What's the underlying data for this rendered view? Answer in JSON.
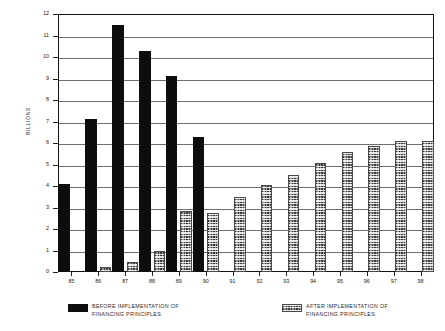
{
  "chart_data": {
    "type": "bar",
    "title": "",
    "xlabel": "",
    "ylabel": "BILLIONS",
    "ylim": [
      0,
      12
    ],
    "ytick_labels": [
      "12",
      "11",
      "10",
      "9",
      "8",
      "7",
      "6",
      "5",
      "4",
      "3",
      "2",
      "1",
      "0"
    ],
    "yticks": [
      12,
      11,
      10,
      9,
      8,
      7,
      6,
      5,
      4,
      3,
      2,
      1,
      0
    ],
    "grid": true,
    "legend_position": "below",
    "categories": [
      "85",
      "86",
      "87",
      "88",
      "89",
      "90",
      "91",
      "92",
      "93",
      "94",
      "95",
      "96",
      "97",
      "98"
    ],
    "series": [
      {
        "name": "BEFORE IMPLEMENTATION OF FINANCING PRINCIPLES",
        "color": "#0d0d0d",
        "values": [
          4.1,
          7.1,
          11.5,
          10.3,
          9.1,
          6.3,
          null,
          null,
          null,
          null,
          null,
          null,
          null,
          null
        ]
      },
      {
        "name": "AFTER IMPLEMENTATION OF FINANCING PRINCIPLES",
        "color": "#9a9a9a",
        "values": [
          null,
          0.25,
          0.45,
          1.0,
          2.85,
          2.75,
          3.5,
          4.05,
          4.5,
          5.05,
          5.6,
          5.85,
          6.1,
          6.1
        ]
      }
    ]
  },
  "axis": {
    "y_title": "BILLIONS"
  },
  "legend": {
    "entries": [
      {
        "line1": "BEFORE IMPLEMENTATION OF",
        "line2": "FINANCING PRINCIPLES",
        "swatch": "black-solid-swatch"
      },
      {
        "line1": "AFTER IMPLEMENTATION OF",
        "line2": "FINANCING PRINCIPLES",
        "swatch": "gray-hatched-swatch"
      }
    ]
  }
}
